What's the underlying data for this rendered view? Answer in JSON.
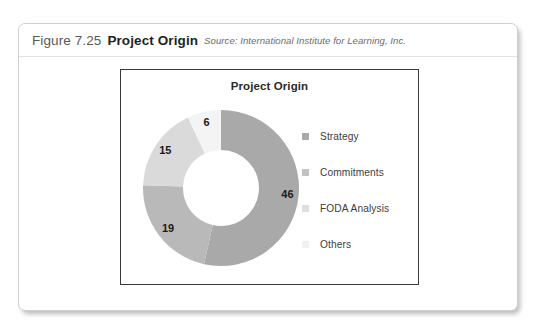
{
  "caption": {
    "figure_number": "Figure 7.25",
    "title": "Project Origin",
    "source": "Source: International Institute for Learning, Inc."
  },
  "chart_data": {
    "type": "pie",
    "variant": "donut",
    "title": "Project Origin",
    "categories": [
      "Strategy",
      "Commitments",
      "FODA Analysis",
      "Others"
    ],
    "values": [
      46,
      19,
      15,
      6
    ],
    "data_labels": [
      "46",
      "19",
      "15",
      "6"
    ],
    "colors": [
      "#a9a9a9",
      "#b9b9b9",
      "#dadada",
      "#f4f4f4"
    ],
    "legend_position": "right",
    "grid": false,
    "start_angle_deg": 0,
    "direction": "clockwise",
    "total": 86
  },
  "legend": {
    "items": [
      {
        "label": "Strategy",
        "color": "#a9a9a9"
      },
      {
        "label": "Commitments",
        "color": "#c2c2c2"
      },
      {
        "label": "FODA Analysis",
        "color": "#dedede"
      },
      {
        "label": "Others",
        "color": "#f1f1f1"
      }
    ]
  }
}
